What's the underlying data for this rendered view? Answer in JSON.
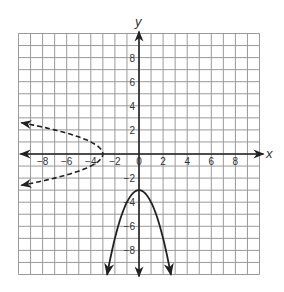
{
  "chart_data": {
    "type": "line",
    "title": "",
    "xlabel": "x",
    "ylabel": "y",
    "xlim": [
      -10,
      10
    ],
    "ylim": [
      -10,
      10
    ],
    "grid": true,
    "grid_step": 1,
    "x_ticks": [
      -8,
      -6,
      -4,
      -2,
      0,
      2,
      4,
      6,
      8
    ],
    "y_ticks": [
      8,
      6,
      4,
      2,
      -2,
      -4,
      -6,
      -8
    ],
    "x_tick_labels": [
      "−8",
      "−6",
      "−4",
      "−2",
      "0",
      "2",
      "4",
      "6",
      "8"
    ],
    "y_tick_labels": [
      "8",
      "6",
      "4",
      "2",
      "−2",
      "−4",
      "−6",
      "−8"
    ],
    "series": [
      {
        "name": "solid parabola (opens downward)",
        "style": "solid",
        "equation": "y = -x^2 - 3",
        "vertex": [
          0,
          -3
        ],
        "arrows": "both ends",
        "points": [
          [
            -2.65,
            -10
          ],
          [
            -2,
            -7
          ],
          [
            -1,
            -4
          ],
          [
            0,
            -3
          ],
          [
            1,
            -4
          ],
          [
            2,
            -7
          ],
          [
            2.65,
            -10
          ]
        ]
      },
      {
        "name": "dashed parabola (opens left)",
        "style": "dashed",
        "equation": "x = -y^2 - 3",
        "vertex": [
          -3,
          0
        ],
        "arrows": "both ends",
        "points": [
          [
            -9.8,
            2.6
          ],
          [
            -7,
            2
          ],
          [
            -4,
            1
          ],
          [
            -3,
            0
          ],
          [
            -4,
            -1
          ],
          [
            -7,
            -2
          ],
          [
            -9.8,
            -2.6
          ]
        ]
      }
    ]
  }
}
